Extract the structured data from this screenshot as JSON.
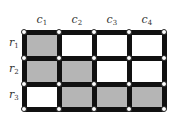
{
  "diagram": {
    "type": "grid",
    "rows": 3,
    "cols": 4,
    "col_labels": [
      {
        "base": "c",
        "sub": "1"
      },
      {
        "base": "c",
        "sub": "2"
      },
      {
        "base": "c",
        "sub": "3"
      },
      {
        "base": "c",
        "sub": "4"
      }
    ],
    "row_labels": [
      {
        "base": "r",
        "sub": "1"
      },
      {
        "base": "r",
        "sub": "2"
      },
      {
        "base": "r",
        "sub": "3"
      }
    ],
    "shaded_cells": [
      [
        true,
        false,
        false,
        false
      ],
      [
        true,
        true,
        false,
        false
      ],
      [
        false,
        true,
        true,
        true
      ]
    ],
    "colors": {
      "shaded": "#b5b5b5",
      "unshaded": "#ffffff",
      "edge": "#111111",
      "node_fill": "#ffffff"
    },
    "geometry": {
      "x": [
        24,
        59,
        94,
        129,
        164
      ],
      "y": [
        32,
        58,
        84,
        109
      ],
      "edge_width": 5
    }
  }
}
